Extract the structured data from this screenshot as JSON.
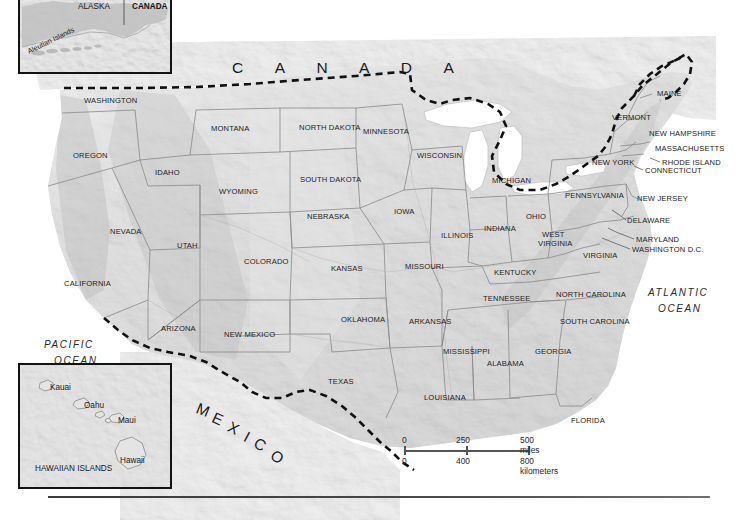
{
  "figure": {
    "name": "reference-map-united-states",
    "countries": [
      {
        "label": "C A N A D A",
        "x": 232,
        "y": 60,
        "kind": "country-title"
      }
    ],
    "oceans": [
      {
        "label_line1": "PACIFIC",
        "label_line2": "OCEAN",
        "x": 44,
        "y": 340
      },
      {
        "label_line1": "ATLANTIC",
        "label_line2": "OCEAN",
        "x": 648,
        "y": 288
      }
    ],
    "mexico": {
      "letters": [
        {
          "ch": "M",
          "x": 197,
          "y": 400,
          "rot": 22
        },
        {
          "ch": "E",
          "x": 213,
          "y": 409,
          "rot": 25
        },
        {
          "ch": "X",
          "x": 229,
          "y": 418,
          "rot": 27
        },
        {
          "ch": "I",
          "x": 245,
          "y": 428,
          "rot": 28
        },
        {
          "ch": "C",
          "x": 255,
          "y": 434,
          "rot": 30
        },
        {
          "ch": "O",
          "x": 272,
          "y": 446,
          "rot": 32
        }
      ],
      "text": "M E X I C O"
    },
    "states": [
      {
        "label": "WASHINGTON",
        "x": 84,
        "y": 97,
        "size": "sm"
      },
      {
        "label": "OREGON",
        "x": 73,
        "y": 152,
        "size": "sm"
      },
      {
        "label": "IDAHO",
        "x": 155,
        "y": 169,
        "size": "sm"
      },
      {
        "label": "MONTANA",
        "x": 211,
        "y": 125,
        "size": "sm"
      },
      {
        "label": "WYOMING",
        "x": 219,
        "y": 188,
        "size": "sm"
      },
      {
        "label": "NEVADA",
        "x": 110,
        "y": 228,
        "size": "sm"
      },
      {
        "label": "UTAH",
        "x": 177,
        "y": 242,
        "size": "sm"
      },
      {
        "label": "CALIFORNIA",
        "x": 64,
        "y": 280,
        "size": "sm"
      },
      {
        "label": "COLORADO",
        "x": 244,
        "y": 258,
        "size": "sm"
      },
      {
        "label": "ARIZONA",
        "x": 161,
        "y": 325,
        "size": "sm"
      },
      {
        "label": "NEW MEXICO",
        "x": 224,
        "y": 331,
        "size": "sm"
      },
      {
        "label": "NORTH DAKOTA",
        "x": 299,
        "y": 124,
        "size": "sm"
      },
      {
        "label": "SOUTH DAKOTA",
        "x": 300,
        "y": 176,
        "size": "sm"
      },
      {
        "label": "NEBRASKA",
        "x": 307,
        "y": 213,
        "size": "sm"
      },
      {
        "label": "KANSAS",
        "x": 331,
        "y": 265,
        "size": "sm"
      },
      {
        "label": "OKLAHOMA",
        "x": 341,
        "y": 316,
        "size": "sm"
      },
      {
        "label": "TEXAS",
        "x": 328,
        "y": 378,
        "size": "sm"
      },
      {
        "label": "MINNESOTA",
        "x": 363,
        "y": 128,
        "size": "sm"
      },
      {
        "label": "IOWA",
        "x": 394,
        "y": 208,
        "size": "sm"
      },
      {
        "label": "MISSOURI",
        "x": 405,
        "y": 263,
        "size": "sm"
      },
      {
        "label": "ARKANSAS",
        "x": 409,
        "y": 318,
        "size": "sm"
      },
      {
        "label": "LOUISIANA",
        "x": 424,
        "y": 394,
        "size": "sm"
      },
      {
        "label": "WISCONSIN",
        "x": 417,
        "y": 152,
        "size": "sm"
      },
      {
        "label": "ILLINOIS",
        "x": 441,
        "y": 232,
        "size": "sm"
      },
      {
        "label": "MICHIGAN",
        "x": 492,
        "y": 177,
        "size": "sm"
      },
      {
        "label": "INDIANA",
        "x": 484,
        "y": 225,
        "size": "sm"
      },
      {
        "label": "OHIO",
        "x": 526,
        "y": 213,
        "size": "sm"
      },
      {
        "label": "KENTUCKY",
        "x": 494,
        "y": 269,
        "size": "sm"
      },
      {
        "label": "TENNESSEE",
        "x": 483,
        "y": 295,
        "size": "sm"
      },
      {
        "label": "MISSISSIPPI",
        "x": 443,
        "y": 348,
        "size": "sm"
      },
      {
        "label": "ALABAMA",
        "x": 487,
        "y": 360,
        "size": "sm"
      },
      {
        "label": "GEORGIA",
        "x": 535,
        "y": 348,
        "size": "sm"
      },
      {
        "label": "FLORIDA",
        "x": 571,
        "y": 417,
        "size": "sm"
      },
      {
        "label": "SOUTH CAROLINA",
        "x": 560,
        "y": 318,
        "size": "sm"
      },
      {
        "label": "NORTH CAROLINA",
        "x": 556,
        "y": 291,
        "size": "sm"
      },
      {
        "label": "VIRGINIA",
        "x": 583,
        "y": 252,
        "size": "sm"
      },
      {
        "label": "WEST",
        "x": 542,
        "y": 231,
        "size": "sm"
      },
      {
        "label": "VIRGINIA",
        "x": 538,
        "y": 240,
        "size": "sm"
      },
      {
        "label": "PENNSYLVANIA",
        "x": 565,
        "y": 192,
        "size": "sm"
      },
      {
        "label": "NEW YORK",
        "x": 592,
        "y": 159,
        "size": "sm"
      },
      {
        "label": "VERMONT",
        "x": 612,
        "y": 114,
        "size": "sm"
      },
      {
        "label": "MAINE",
        "x": 657,
        "y": 90,
        "size": "sm"
      },
      {
        "label": "NEW HAMPSHIRE",
        "x": 649,
        "y": 130,
        "size": "sm"
      },
      {
        "label": "MASSACHUSETTS",
        "x": 655,
        "y": 145,
        "size": "sm"
      },
      {
        "label": "RHODE ISLAND",
        "x": 662,
        "y": 159,
        "size": "sm"
      },
      {
        "label": "CONNECTICUT",
        "x": 645,
        "y": 167,
        "size": "sm"
      },
      {
        "label": "NEW JERSEY",
        "x": 637,
        "y": 195,
        "size": "sm"
      },
      {
        "label": "DELAWARE",
        "x": 627,
        "y": 217,
        "size": "sm"
      },
      {
        "label": "MARYLAND",
        "x": 636,
        "y": 236,
        "size": "sm"
      },
      {
        "label": "WASHINGTON D.C.",
        "x": 632,
        "y": 246,
        "size": "sm"
      }
    ],
    "insets": [
      {
        "name": "alaska",
        "labels": [
          {
            "text": "ALASKA",
            "x": 58,
            "y": 10,
            "bold": false,
            "small": false,
            "rot": 0
          },
          {
            "text": "CANADA",
            "x": 112,
            "y": 10,
            "bold": true,
            "small": false,
            "rot": 0
          },
          {
            "text": "Aleutian Islands",
            "x": 8,
            "y": 55,
            "bold": false,
            "small": true,
            "rot": -26
          }
        ]
      },
      {
        "name": "hawaii",
        "labels": [
          {
            "text": "Kauai",
            "x": 30,
            "y": 19,
            "bold": false,
            "small": false,
            "rot": 0
          },
          {
            "text": "Oahu",
            "x": 64,
            "y": 37,
            "bold": false,
            "small": false,
            "rot": 0
          },
          {
            "text": "Maui",
            "x": 98,
            "y": 52,
            "bold": false,
            "small": false,
            "rot": 0
          },
          {
            "text": "Hawaii",
            "x": 100,
            "y": 92,
            "bold": false,
            "small": false,
            "rot": 0
          },
          {
            "text": "HAWAIIAN ISLANDS",
            "x": 15,
            "y": 100,
            "bold": false,
            "small": false,
            "rot": 0
          }
        ]
      }
    ],
    "scale_bar": {
      "name": "map-scale-bar",
      "miles": {
        "min": "0",
        "mid": "250",
        "max": "500 miles"
      },
      "kilometers": {
        "min": "0",
        "mid": "400",
        "max": "800 kilometers"
      }
    },
    "colors": {
      "land": "#d8d8d8",
      "land_light": "#e8e8e8",
      "water": "#ffffff",
      "state_border": "#8c8c8c",
      "country_border": "#111111",
      "text": "#1b1b1b",
      "inset_frame": "#131313"
    }
  }
}
